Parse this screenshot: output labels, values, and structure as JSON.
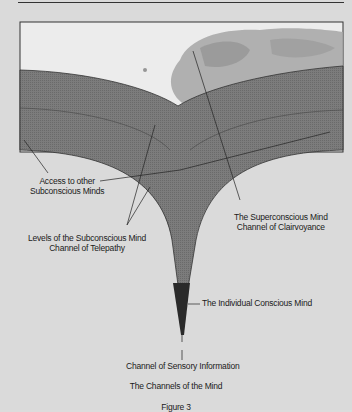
{
  "figure": {
    "title": "The Channels of the Mind",
    "number": "Figure 3",
    "colors": {
      "background": "#dadada",
      "frame_border": "#333333",
      "sky": "#ececec",
      "cloud": "#9a9a9a",
      "subconscious_band": "#7a7a7a",
      "conscious_mind": "#2a2a2a"
    },
    "labels": {
      "access": [
        "Access to other",
        "Subconscious Minds"
      ],
      "levels": [
        "Levels of the Subconscious Mind",
        "Channel of Telepathy"
      ],
      "superconscious": [
        "The Superconscious Mind",
        "Channel of Clairvoyance"
      ],
      "conscious": "The Individual Conscious Mind",
      "sensory": "Channel of Sensory Information"
    }
  }
}
